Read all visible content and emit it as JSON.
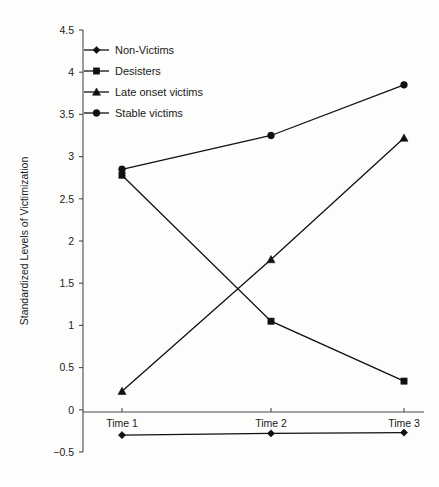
{
  "chart_data": {
    "type": "line",
    "title": "",
    "xlabel": "",
    "ylabel": "Standardized Levels of Victimization",
    "categories": [
      "Time 1",
      "Time 2",
      "Time 3"
    ],
    "ylim": [
      -0.5,
      4.5
    ],
    "y_ticks": [
      -0.5,
      0,
      0.5,
      1,
      1.5,
      2,
      2.5,
      3,
      3.5,
      4,
      4.5
    ],
    "y_tick_labels": [
      "−0.5",
      "0",
      "0.5",
      "1",
      "1.5",
      "2",
      "2.5",
      "3",
      "3.5",
      "4",
      "4.5"
    ],
    "grid": false,
    "legend_position": "top-left",
    "series": [
      {
        "name": "Non-Victims",
        "marker": "diamond",
        "color": "#111111",
        "values": [
          -0.3,
          -0.28,
          -0.27
        ]
      },
      {
        "name": "Desisters",
        "marker": "square",
        "color": "#111111",
        "values": [
          2.78,
          1.05,
          0.34
        ]
      },
      {
        "name": "Late onset victims",
        "marker": "triangle",
        "color": "#111111",
        "values": [
          0.22,
          1.78,
          3.22
        ]
      },
      {
        "name": "Stable victims",
        "marker": "circle",
        "color": "#111111",
        "values": [
          2.85,
          3.25,
          3.85
        ]
      }
    ]
  },
  "colors": {
    "ink": "#111111",
    "axis": "#4a4a4a",
    "background": "#fdfdfc"
  }
}
